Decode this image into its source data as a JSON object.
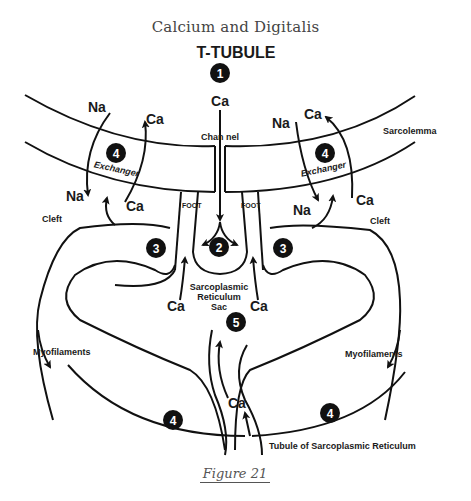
{
  "title": "Calcium and Digitalis",
  "caption": "Figure 21",
  "diagram": {
    "heading": "T-TUBULE",
    "markers": [
      {
        "id": "1",
        "label": "1"
      },
      {
        "id": "2",
        "label": "2"
      },
      {
        "id": "3-left",
        "label": "3"
      },
      {
        "id": "3-right",
        "label": "3"
      },
      {
        "id": "4-left-exchanger",
        "label": "4"
      },
      {
        "id": "4-right-exchanger",
        "label": "4"
      },
      {
        "id": "4-bottom-left",
        "label": "4"
      },
      {
        "id": "4-bottom-right",
        "label": "4"
      },
      {
        "id": "5",
        "label": "5"
      }
    ],
    "labels": {
      "sarcolemma": "Sarcolemma",
      "channel": "Chan nel",
      "cleft_left": "Cleft",
      "cleft_right": "Cleft",
      "foot_left": "FOOT",
      "foot_right": "FOOT",
      "exchanger_left": "Exchanger",
      "exchanger_right": "Exchanger",
      "sr_sac_line1": "Sarcoplasmic",
      "sr_sac_line2": "Reticulum",
      "sr_sac_line3": "Sac",
      "myofilaments_left": "Myofilaments",
      "myofilaments_right": "Myofilaments",
      "tubule_sr": "Tubule of Sarcoplasmic Reticulum"
    },
    "ions": {
      "ca_channel": "Ca",
      "na_left_top": "Na",
      "ca_left_top": "Ca",
      "na_left_bottom": "Na",
      "ca_left_bottom": "Ca",
      "na_right_top": "Na",
      "ca_right_top": "Ca",
      "na_right_bottom": "Na",
      "ca_right_bottom": "Ca",
      "ca_sac_left": "Ca",
      "ca_sac_right": "Ca",
      "ca_tubule": "Ca"
    }
  }
}
